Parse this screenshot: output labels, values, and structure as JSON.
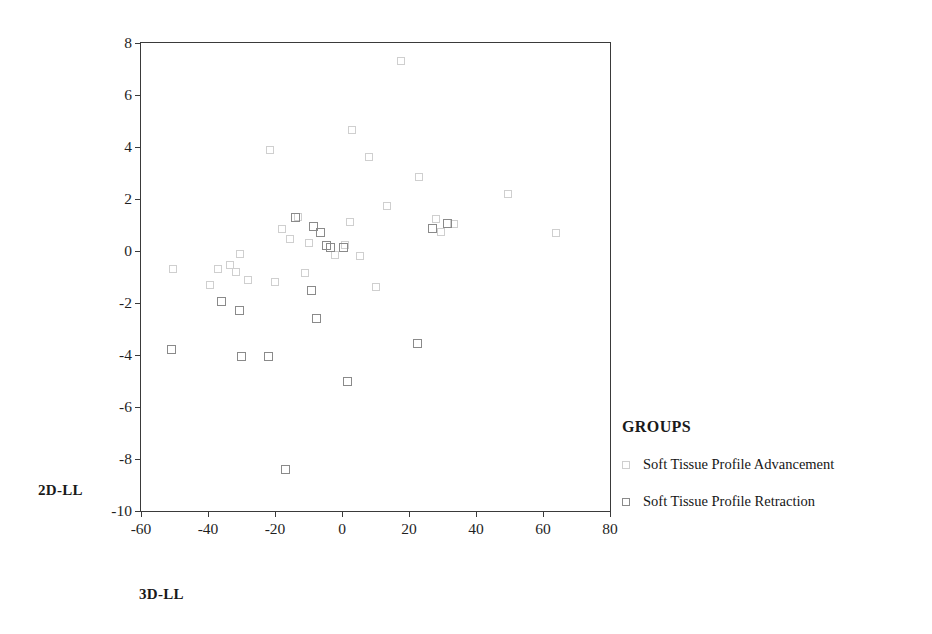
{
  "chart_data": {
    "type": "scatter",
    "title": "",
    "xlabel": "3D-LL",
    "ylabel": "2D-LL",
    "xlim": [
      -60,
      80
    ],
    "ylim": [
      -10,
      8
    ],
    "xticks": [
      -60,
      -40,
      -20,
      0,
      20,
      40,
      60,
      80
    ],
    "yticks": [
      8,
      6,
      4,
      2,
      0,
      -2,
      -4,
      -6,
      -8,
      -10
    ],
    "grid": false,
    "legend_title": "GROUPS",
    "legend_position": "right",
    "colors": {
      "advancement": "#cfcfcf",
      "retraction": "#8a8a8a",
      "axis": "#3a3a3a"
    },
    "series": [
      {
        "name": "Soft Tissue Profile Advancement",
        "marker": "open-square",
        "color": "#cfcfcf",
        "points": [
          [
            17.5,
            7.3
          ],
          [
            3.0,
            4.65
          ],
          [
            -21.5,
            3.9
          ],
          [
            8.0,
            3.6
          ],
          [
            23.0,
            2.85
          ],
          [
            49.5,
            2.2
          ],
          [
            13.5,
            1.75
          ],
          [
            -13.0,
            1.3
          ],
          [
            28.0,
            1.25
          ],
          [
            33.5,
            1.05
          ],
          [
            2.5,
            1.1
          ],
          [
            -18.0,
            0.85
          ],
          [
            64.0,
            0.7
          ],
          [
            29.5,
            0.75
          ],
          [
            -15.5,
            0.45
          ],
          [
            -10.0,
            0.3
          ],
          [
            1.0,
            0.25
          ],
          [
            -30.5,
            -0.1
          ],
          [
            -2.0,
            -0.15
          ],
          [
            5.5,
            -0.2
          ],
          [
            -33.5,
            -0.55
          ],
          [
            -50.5,
            -0.7
          ],
          [
            -37.0,
            -0.7
          ],
          [
            -31.5,
            -0.8
          ],
          [
            -28.0,
            -1.1
          ],
          [
            -20.0,
            -1.2
          ],
          [
            -11.0,
            -0.85
          ],
          [
            10.0,
            -1.4
          ],
          [
            -39.5,
            -1.3
          ]
        ]
      },
      {
        "name": "Soft Tissue Profile Retraction",
        "marker": "open-square",
        "color": "#8a8a8a",
        "points": [
          [
            -14.0,
            1.3
          ],
          [
            -8.5,
            0.95
          ],
          [
            -6.5,
            0.7
          ],
          [
            -4.5,
            0.2
          ],
          [
            -3.5,
            0.15
          ],
          [
            0.5,
            0.15
          ],
          [
            27.0,
            0.85
          ],
          [
            31.5,
            1.05
          ],
          [
            -36.0,
            -1.95
          ],
          [
            -30.5,
            -2.3
          ],
          [
            -9.0,
            -1.5
          ],
          [
            -7.5,
            -2.6
          ],
          [
            -30.0,
            -4.05
          ],
          [
            -22.0,
            -4.05
          ],
          [
            -51.0,
            -3.8
          ],
          [
            22.5,
            -3.55
          ],
          [
            1.5,
            -5.0
          ],
          [
            -17.0,
            -8.4
          ]
        ]
      }
    ]
  },
  "legend": {
    "title": "GROUPS",
    "items": [
      {
        "label": "Soft Tissue Profile Advancement",
        "style": "adv"
      },
      {
        "label": "Soft Tissue Profile Retraction",
        "style": "ret"
      }
    ]
  },
  "axes": {
    "x_title": "3D-LL",
    "y_title": "2D-LL"
  }
}
